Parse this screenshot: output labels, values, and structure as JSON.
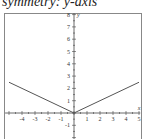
{
  "caption": "symmetry: y-axis",
  "chart_data": {
    "type": "line",
    "title": "symmetry: y-axis",
    "function": "y = |x| / 2",
    "xlabel": "x",
    "ylabel": "y",
    "xlim": [
      -5,
      5
    ],
    "ylim": [
      -2,
      8
    ],
    "x_ticks": [
      -4,
      -3,
      -2,
      -1,
      1,
      2,
      3,
      4,
      5
    ],
    "y_ticks": [
      -1,
      1,
      2,
      3,
      4,
      5,
      6,
      7,
      8
    ],
    "grid": false,
    "series": [
      {
        "name": "y = |x|/2",
        "x": [
          -5,
          -4,
          -3,
          -2,
          -1,
          0,
          1,
          2,
          3,
          4,
          5
        ],
        "y": [
          2.5,
          2,
          1.5,
          1,
          0.5,
          0,
          0.5,
          1,
          1.5,
          2,
          2.5
        ]
      }
    ],
    "colors": {
      "line": "#555555",
      "axis": "#444444",
      "frame": "#888888"
    }
  }
}
